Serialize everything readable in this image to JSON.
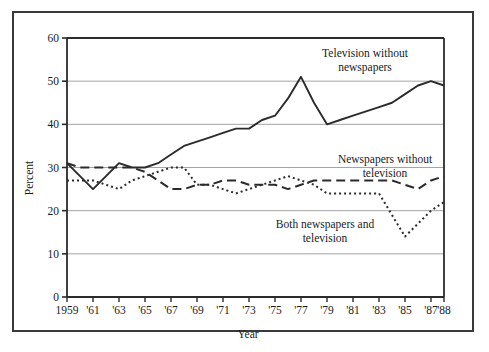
{
  "chart_data": {
    "type": "line",
    "title": "",
    "xlabel": "Year",
    "ylabel": "Percent",
    "ylim": [
      0,
      60
    ],
    "yticks": [
      0,
      10,
      20,
      30,
      40,
      50,
      60
    ],
    "ytick_labels": [
      "0",
      "10",
      "20",
      "30",
      "40",
      "50",
      "60"
    ],
    "xlim": [
      1959,
      1988
    ],
    "xticks": [
      1959,
      1961,
      1963,
      1965,
      1967,
      1969,
      1971,
      1973,
      1975,
      1977,
      1979,
      1981,
      1983,
      1985,
      1987,
      1988
    ],
    "xtick_labels": [
      "1959",
      "'61",
      "'63",
      "'65",
      "'67",
      "'69",
      "'71",
      "'73",
      "'75",
      "'77",
      "'79",
      "'81",
      "'83",
      "'85",
      "'87",
      "'88"
    ],
    "grid": "horizontal",
    "legend_position": "inline-annotations",
    "x": [
      1959,
      1960,
      1961,
      1962,
      1963,
      1964,
      1965,
      1966,
      1967,
      1968,
      1969,
      1970,
      1971,
      1972,
      1973,
      1974,
      1975,
      1976,
      1977,
      1978,
      1979,
      1980,
      1981,
      1982,
      1983,
      1984,
      1985,
      1986,
      1987,
      1988
    ],
    "series": [
      {
        "name": "Television without newspapers",
        "style": "solid",
        "color": "#2b2b2b",
        "values": [
          31,
          28,
          25,
          28,
          31,
          30,
          30,
          31,
          33,
          35,
          36,
          37,
          38,
          39,
          39,
          41,
          42,
          46,
          51,
          45,
          40,
          41,
          42,
          43,
          44,
          45,
          47,
          49,
          50,
          49
        ]
      },
      {
        "name": "Newspapers without television",
        "style": "dashed",
        "color": "#2b2b2b",
        "values": [
          31,
          30,
          30,
          30,
          30,
          30,
          29,
          27,
          25,
          25,
          26,
          26,
          27,
          27,
          26,
          26,
          26,
          25,
          26,
          27,
          27,
          27,
          27,
          27,
          27,
          27,
          26,
          25,
          27,
          28
        ]
      },
      {
        "name": "Both newspapers and television",
        "style": "dotted",
        "color": "#2b2b2b",
        "values": [
          27,
          27,
          27,
          26,
          25,
          27,
          28,
          29,
          30,
          30,
          26,
          26,
          25,
          24,
          25,
          26,
          27,
          28,
          27,
          26,
          24,
          24,
          24,
          24,
          24,
          19,
          14,
          17,
          20,
          22
        ]
      }
    ],
    "annotations": [
      {
        "name": "television-without-newspapers-label",
        "lines": [
          "Television without",
          "newspapers"
        ],
        "x": 365,
        "y": 57
      },
      {
        "name": "newspapers-without-television-label",
        "lines": [
          "Newspapers without",
          "television"
        ],
        "x": 385,
        "y": 163
      },
      {
        "name": "both-newspapers-and-television-label",
        "lines": [
          "Both newspapers and",
          "television"
        ],
        "x": 325,
        "y": 228
      }
    ]
  }
}
